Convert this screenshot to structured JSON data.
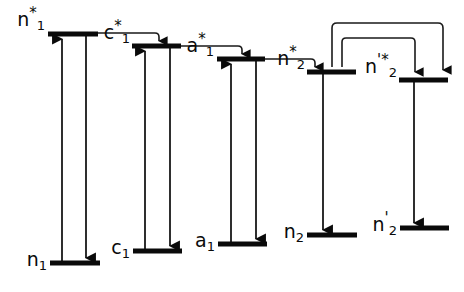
{
  "figure": {
    "kind": "energy-level-diagram",
    "title": "",
    "width": 464,
    "height": 292,
    "background_color": "#ffffff",
    "ink_color": "#0a0a0a"
  },
  "levels": [
    {
      "id": "n1-star",
      "label": "n",
      "sub": "1",
      "sup": "*",
      "kind": "excited",
      "bar": {
        "x1": 48,
        "x2": 98,
        "y": 34
      },
      "label_x": 45,
      "label_y": 30
    },
    {
      "id": "c1-star",
      "label": "c",
      "sub": "1",
      "sup": "*",
      "kind": "excited",
      "bar": {
        "x1": 132,
        "x2": 181,
        "y": 46
      },
      "label_x": 130,
      "label_y": 43
    },
    {
      "id": "a1-star",
      "label": "a",
      "sub": "1",
      "sup": "*",
      "kind": "excited",
      "bar": {
        "x1": 217,
        "x2": 265,
        "y": 59
      },
      "label_x": 214,
      "label_y": 56
    },
    {
      "id": "n2-star",
      "label": "n",
      "sub": "2",
      "sup": "*",
      "kind": "excited",
      "bar": {
        "x1": 307,
        "x2": 356,
        "y": 72
      },
      "label_x": 305,
      "label_y": 69
    },
    {
      "id": "n2-prime-star",
      "label": "n",
      "sub": "2",
      "sup": "'*",
      "kind": "excited",
      "bar": {
        "x1": 399,
        "x2": 448,
        "y": 80
      },
      "label_x": 397,
      "label_y": 77
    },
    {
      "id": "n1",
      "label": "n",
      "sub": "1",
      "sup": "",
      "kind": "ground",
      "bar": {
        "x1": 50,
        "x2": 100,
        "y": 263
      },
      "label_x": 47,
      "label_y": 270
    },
    {
      "id": "c1",
      "label": "c",
      "sub": "1",
      "sup": "",
      "kind": "ground",
      "bar": {
        "x1": 133,
        "x2": 182,
        "y": 251
      },
      "label_x": 130,
      "label_y": 258
    },
    {
      "id": "a1",
      "label": "a",
      "sub": "1",
      "sup": "",
      "kind": "ground",
      "bar": {
        "x1": 218,
        "x2": 267,
        "y": 244
      },
      "label_x": 215,
      "label_y": 251
    },
    {
      "id": "n2",
      "label": "n",
      "sub": "2",
      "sup": "",
      "kind": "ground",
      "bar": {
        "x1": 307,
        "x2": 357,
        "y": 235
      },
      "label_x": 304,
      "label_y": 242
    },
    {
      "id": "n2-prime",
      "label": "n",
      "sub": "2",
      "sup": "'",
      "kind": "ground",
      "bar": {
        "x1": 400,
        "x2": 449,
        "y": 228
      },
      "label_x": 397,
      "label_y": 235
    }
  ],
  "vertical_transitions": [
    {
      "id": "n1-absorption",
      "from": "n1",
      "to": "n1-star",
      "x": 62,
      "y_top": 36,
      "y_bottom": 261,
      "direction": "up"
    },
    {
      "id": "n1-emission",
      "from": "n1-star",
      "to": "n1",
      "x": 86,
      "y_top": 36,
      "y_bottom": 261,
      "direction": "down"
    },
    {
      "id": "c1-absorption",
      "from": "c1",
      "to": "c1-star",
      "x": 145,
      "y_top": 48,
      "y_bottom": 249,
      "direction": "up"
    },
    {
      "id": "c1-emission",
      "from": "c1-star",
      "to": "c1",
      "x": 170,
      "y_top": 48,
      "y_bottom": 249,
      "direction": "down"
    },
    {
      "id": "a1-absorption",
      "from": "a1",
      "to": "a1-star",
      "x": 231,
      "y_top": 61,
      "y_bottom": 242,
      "direction": "up"
    },
    {
      "id": "a1-emission",
      "from": "a1-star",
      "to": "a1",
      "x": 256,
      "y_top": 61,
      "y_bottom": 242,
      "direction": "down"
    },
    {
      "id": "n2-emission",
      "from": "n2-star",
      "to": "n2",
      "x": 323,
      "y_top": 74,
      "y_bottom": 233,
      "direction": "down"
    },
    {
      "id": "n2-prime-emission",
      "from": "n2-prime-star",
      "to": "n2-prime",
      "x": 414,
      "y_top": 82,
      "y_bottom": 226,
      "direction": "down"
    }
  ],
  "routed_transitions": [
    {
      "id": "n1star-to-c1star",
      "from": "n1-star",
      "to": "c1-star",
      "path": "M 96 33 L 155 33 Q 159 33 159 37 L 159 41",
      "arrow_at": {
        "x": 159,
        "y": 44
      }
    },
    {
      "id": "c1star-to-a1star",
      "from": "c1-star",
      "to": "a1-star",
      "path": "M 179 46 L 238 46 Q 242 46 242 50 L 242 54",
      "arrow_at": {
        "x": 242,
        "y": 57
      }
    },
    {
      "id": "a1star-to-n2star",
      "from": "a1-star",
      "to": "n2-star",
      "path": "M 263 59 L 311 59 Q 315 59 315 63 L 315 67",
      "arrow_at": {
        "x": 315,
        "y": 70
      }
    },
    {
      "id": "n2star-loop-outer",
      "from": "n2-prime-star",
      "to": "n2-star",
      "path": "M 332 67 L 332 28 Q 332 23 337 23 L 438 23 Q 443 23 443 28 L 443 70",
      "arrow_at": {
        "x": 443,
        "y": 73
      }
    },
    {
      "id": "n2star-loop-inner",
      "from": "n2-star",
      "to": "n2-prime-star",
      "path": "M 342 67 L 342 42 Q 342 38 346 38 L 411 38 Q 415 38 415 42 L 415 72",
      "arrow_at": {
        "x": 415,
        "y": 75
      }
    }
  ]
}
